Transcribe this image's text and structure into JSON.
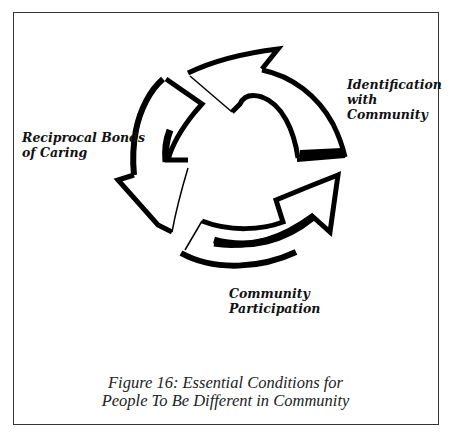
{
  "diagram": {
    "type": "cycle",
    "nodes": [
      {
        "id": "identification",
        "label_lines": [
          "Identification",
          "with",
          "Community"
        ]
      },
      {
        "id": "participation",
        "label_lines": [
          "Community",
          "Participation"
        ]
      },
      {
        "id": "reciprocal",
        "label_lines": [
          "Reciprocal Bonds",
          "of Caring"
        ]
      }
    ],
    "edges": [
      {
        "from": "identification",
        "to": "participation",
        "direction": "clockwise"
      },
      {
        "from": "participation",
        "to": "reciprocal",
        "direction": "clockwise"
      },
      {
        "from": "reciprocal",
        "to": "identification",
        "direction": "clockwise"
      }
    ]
  },
  "labels": {
    "identification": {
      "line1": "Identification",
      "line2": "with",
      "line3": "Community"
    },
    "reciprocal": {
      "line1": "Reciprocal Bonds",
      "line2": "of Caring"
    },
    "participation": {
      "line1": "Community",
      "line2": "Participation"
    }
  },
  "caption": {
    "line1": "Figure 16: Essential Conditions for",
    "line2": "People To Be Different in Community"
  },
  "colors": {
    "stroke": "#000000",
    "border": "#333333",
    "background": "#ffffff"
  }
}
